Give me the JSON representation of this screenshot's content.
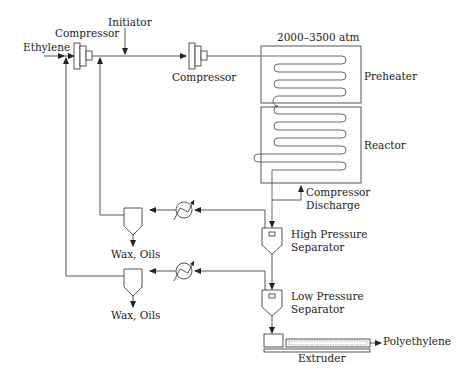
{
  "diagram": {
    "labels": {
      "ethylene": "Ethylene",
      "compressor_primary": "Compressor",
      "initiator": "Initiator",
      "compressor_secondary": "Compressor",
      "pressure": "2000–3500 atm",
      "preheater": "Preheater",
      "reactor": "Reactor",
      "compressor_discharge_1": "Compressor",
      "compressor_discharge_2": "Discharge",
      "hps_1": "High Pressure",
      "hps_2": "Separator",
      "lps_1": "Low Pressure",
      "lps_2": "Separator",
      "wax_oils_upper": "Wax, Oils",
      "wax_oils_lower": "Wax, Oils",
      "polyethylene": "Polyethylene",
      "extruder": "Extruder"
    },
    "nodes": [
      {
        "id": "primary-compressor",
        "type": "compressor"
      },
      {
        "id": "secondary-compressor",
        "type": "compressor"
      },
      {
        "id": "preheater",
        "type": "heat-exchanger-coil"
      },
      {
        "id": "reactor",
        "type": "tubular-reactor"
      },
      {
        "id": "high-pressure-separator",
        "type": "separator"
      },
      {
        "id": "low-pressure-separator",
        "type": "separator"
      },
      {
        "id": "upper-cooler",
        "type": "cooler"
      },
      {
        "id": "lower-cooler",
        "type": "cooler"
      },
      {
        "id": "upper-wax-separator",
        "type": "separator"
      },
      {
        "id": "lower-wax-separator",
        "type": "separator"
      },
      {
        "id": "extruder",
        "type": "extruder"
      }
    ],
    "edges": [
      {
        "from": "Ethylene",
        "to": "primary-compressor"
      },
      {
        "from": "Initiator",
        "to": "main-line"
      },
      {
        "from": "primary-compressor",
        "to": "secondary-compressor"
      },
      {
        "from": "secondary-compressor",
        "to": "preheater"
      },
      {
        "from": "preheater",
        "to": "reactor"
      },
      {
        "from": "reactor",
        "to": "high-pressure-separator"
      },
      {
        "from": "reactor",
        "to": "Compressor Discharge"
      },
      {
        "from": "high-pressure-separator",
        "to": "upper-cooler"
      },
      {
        "from": "upper-cooler",
        "to": "upper-wax-separator"
      },
      {
        "from": "upper-wax-separator",
        "to": "Wax, Oils"
      },
      {
        "from": "upper-wax-separator",
        "to": "secondary-compressor-inlet"
      },
      {
        "from": "high-pressure-separator",
        "to": "low-pressure-separator"
      },
      {
        "from": "low-pressure-separator",
        "to": "lower-cooler"
      },
      {
        "from": "lower-cooler",
        "to": "lower-wax-separator"
      },
      {
        "from": "lower-wax-separator",
        "to": "Wax, Oils"
      },
      {
        "from": "lower-wax-separator",
        "to": "primary-compressor-inlet"
      },
      {
        "from": "low-pressure-separator",
        "to": "extruder"
      },
      {
        "from": "extruder",
        "to": "Polyethylene"
      }
    ]
  }
}
